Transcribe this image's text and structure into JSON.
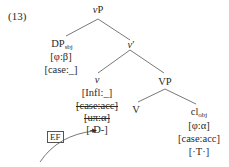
{
  "example_number": "(13)",
  "tree": {
    "root": {
      "label": "v",
      "label_suffix": "P"
    },
    "dp_subject": {
      "label": "DP",
      "subscript": "sbj",
      "features": [
        "[φ:β]",
        "[case:_]"
      ]
    },
    "v_bar": {
      "label": "v",
      "label_suffix": "′"
    },
    "v_head": {
      "label": "v",
      "features": [
        "[Infl:_]",
        "[case:acc]",
        "[uπ:α]",
        "[-D-]"
      ],
      "struck_features": [
        "[case:acc]",
        "[uπ:α]"
      ]
    },
    "vp": {
      "label": "VP"
    },
    "verb": {
      "label": "V"
    },
    "clitic_object": {
      "label": "cl",
      "subscript": "obj",
      "features": [
        "[φ:α]",
        "[case:acc]",
        "[·T·]"
      ]
    }
  },
  "annotation": {
    "ef_box": "EF",
    "arrow": "curved arrow pointing to [-D-]"
  }
}
